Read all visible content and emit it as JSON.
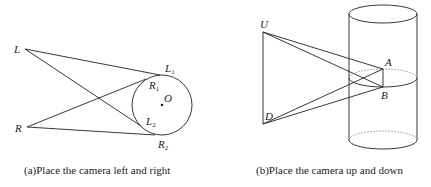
{
  "figure_a": {
    "caption": "(a)Place the camera left and right",
    "labels": {
      "L": "L",
      "R": "R",
      "O": "O",
      "L1": "L",
      "L1_sub": "1",
      "R1": "R",
      "R1_sub": "1",
      "L2": "L",
      "L2_sub": "2",
      "R2": "R",
      "R2_sub": "2"
    }
  },
  "figure_b": {
    "caption": "(b)Place the camera up and down",
    "labels": {
      "U": "U",
      "D": "D",
      "A": "A",
      "B": "B"
    }
  },
  "colors": {
    "stroke": "#222222",
    "background": "#ffffff"
  }
}
